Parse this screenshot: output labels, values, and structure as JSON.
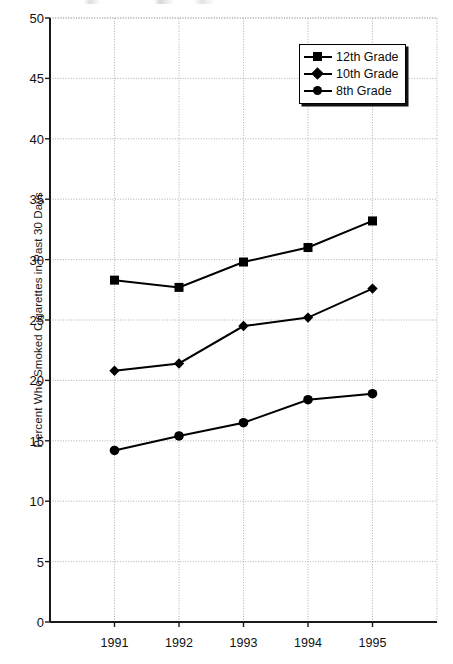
{
  "chart_data": {
    "type": "line",
    "title": "",
    "xlabel": "",
    "ylabel": "Percent Who Smoked Cigarettes in Past 30 Days",
    "categories": [
      "1991",
      "1992",
      "1993",
      "1994",
      "1995"
    ],
    "x": [
      1991,
      1992,
      1993,
      1994,
      1995
    ],
    "xlim": [
      1990.5,
      1995.5
    ],
    "ylim": [
      0,
      50
    ],
    "ytick_labels": [
      "0",
      "5",
      "10",
      "15",
      "20",
      "25",
      "30",
      "35",
      "40",
      "45",
      "50"
    ],
    "yticks": [
      0,
      5,
      10,
      15,
      20,
      25,
      30,
      35,
      40,
      45,
      50
    ],
    "grid": true,
    "legend_position": "top-right",
    "series": [
      {
        "name": "12th Grade",
        "marker": "square",
        "color": "#000000",
        "values": [
          28.3,
          27.7,
          29.8,
          31.0,
          33.2
        ]
      },
      {
        "name": "10th Grade",
        "marker": "diamond",
        "color": "#000000",
        "values": [
          20.8,
          21.4,
          24.5,
          25.2,
          27.6
        ]
      },
      {
        "name": "8th Grade",
        "marker": "circle",
        "color": "#000000",
        "values": [
          14.2,
          15.4,
          16.5,
          18.4,
          18.9
        ]
      }
    ]
  },
  "legend": {
    "items": [
      {
        "label": "12th Grade",
        "marker": "square"
      },
      {
        "label": "10th Grade",
        "marker": "diamond"
      },
      {
        "label": "8th Grade",
        "marker": "circle"
      }
    ]
  },
  "axes": {
    "y_title": "Percent Who Smoked Cigarettes in Past 30 Days"
  }
}
